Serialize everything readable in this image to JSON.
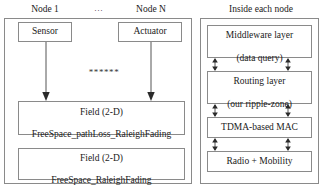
{
  "figure": {
    "type": "block-diagram",
    "left_panel": {
      "node_labels": [
        {
          "name": "node-1",
          "text": "Node 1"
        },
        {
          "name": "node-ellipsis",
          "text": "..."
        },
        {
          "name": "node-n",
          "text": "Node N"
        }
      ],
      "node_boxes": [
        {
          "name": "sensor",
          "text": "Sensor"
        },
        {
          "name": "actuator",
          "text": "Actuator"
        }
      ],
      "repeat_marker": "******",
      "field_boxes": [
        {
          "name": "field-pathloss",
          "line1": "Field (2-D)",
          "line2": "FreeSpace_pathLoss_RaleighFading"
        },
        {
          "name": "field-raleigh",
          "line1": "Field (2-D)",
          "line2": "FreeSpace_RaleighFading"
        }
      ]
    },
    "right_panel": {
      "caption": "Inside each node",
      "stack": [
        {
          "name": "middleware-layer",
          "line1": "Middleware layer",
          "line2": "(data query)"
        },
        {
          "name": "routing-layer",
          "line1": "Routing layer",
          "line2": "(our ripple-zone)"
        },
        {
          "name": "tdma-mac",
          "line1": "TDMA-based MAC",
          "line2": ""
        },
        {
          "name": "radio-mobility",
          "line1": "Radio + Mobility",
          "line2": ""
        }
      ]
    },
    "colors": {
      "stroke": "#8a8a8a",
      "text": "#1a1a1a",
      "background": "#ffffff"
    }
  }
}
